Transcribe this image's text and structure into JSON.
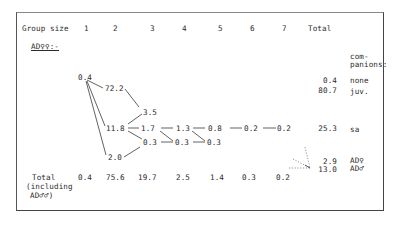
{
  "header": {
    "row_label": "Group size",
    "group_sizes": [
      "1",
      "2",
      "3",
      "4",
      "5",
      "6",
      "7"
    ],
    "total_label": "Total"
  },
  "section_label": "AD♀♀:-",
  "companions_header": [
    "com-",
    "panions:"
  ],
  "nodes": {
    "g1_a": "0.4",
    "g2_juv": "72.2",
    "g2_sa": "11.8",
    "g2_ad": "2.0",
    "g3_a": "3.5",
    "g3_b": "1.7",
    "g3_c": "0.3",
    "g4_a": "1.3",
    "g4_b": "0.3",
    "g5_a": "0.8",
    "g5_b": "0.3",
    "g6_a": "0.2",
    "g7_a": "0.2"
  },
  "row_totals": [
    {
      "value": "0.4",
      "companions": "none"
    },
    {
      "value": "80.7",
      "companions": "juv."
    },
    {
      "value": "25.3",
      "companions": "sa"
    },
    {
      "value": "2.9",
      "companions": "AD♀"
    },
    {
      "value": "13.0",
      "companions": "AD♂"
    }
  ],
  "column_totals": {
    "label": "Total",
    "label_line2": "(including",
    "label_line3": "AD♂♂)",
    "values": [
      "0.4",
      "75.6",
      "19.7",
      "2.5",
      "1.4",
      "0.3",
      "0.2"
    ]
  },
  "colors": {
    "ink": "#2b2b2b",
    "frame": "#444444",
    "background": "#ffffff"
  }
}
